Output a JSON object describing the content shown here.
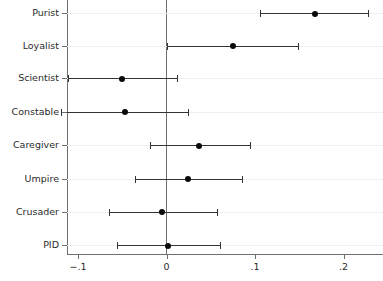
{
  "chart_data": {
    "type": "scatter",
    "subtype": "dot-and-whisker coefficient plot",
    "title": "",
    "subtitle": "",
    "xlabel": "",
    "ylabel": "",
    "xlim": [
      -0.13,
      0.245
    ],
    "ylim": [
      0,
      9
    ],
    "grid": true,
    "legend": null,
    "reference_line": 0,
    "xticks": [
      -0.1,
      0,
      0.1,
      0.2
    ],
    "xticklabels": [
      "−.1",
      "0",
      ".1",
      ".2"
    ],
    "categories": [
      "Purist",
      "Loyalist",
      "Scientist",
      "Constable",
      "Caregiver",
      "Umpire",
      "Crusader",
      "PID"
    ],
    "series": [
      {
        "name": "coefficient",
        "values": [
          0.168,
          0.075,
          -0.05,
          -0.047,
          0.037,
          0.024,
          -0.005,
          0.002
        ],
        "ci_low": [
          0.106,
          0.0,
          -0.111,
          -0.119,
          -0.019,
          -0.036,
          -0.065,
          -0.056
        ],
        "ci_high": [
          0.228,
          0.149,
          0.012,
          0.024,
          0.094,
          0.085,
          0.057,
          0.061
        ]
      }
    ],
    "points": [
      {
        "label": "Purist",
        "estimate": 0.168,
        "ci_low": 0.106,
        "ci_high": 0.228
      },
      {
        "label": "Loyalist",
        "estimate": 0.075,
        "ci_low": 0.0,
        "ci_high": 0.149
      },
      {
        "label": "Scientist",
        "estimate": -0.05,
        "ci_low": -0.111,
        "ci_high": 0.012
      },
      {
        "label": "Constable",
        "estimate": -0.047,
        "ci_low": -0.119,
        "ci_high": 0.024
      },
      {
        "label": "Caregiver",
        "estimate": 0.037,
        "ci_low": -0.019,
        "ci_high": 0.094
      },
      {
        "label": "Umpire",
        "estimate": 0.024,
        "ci_low": -0.036,
        "ci_high": 0.085
      },
      {
        "label": "Crusader",
        "estimate": -0.005,
        "ci_low": -0.065,
        "ci_high": 0.057
      },
      {
        "label": "PID",
        "estimate": 0.002,
        "ci_low": -0.056,
        "ci_high": 0.061
      }
    ],
    "colors": {
      "marker": "#0a0a0a",
      "whisker": "#333333",
      "axis": "#6f6f6f",
      "grid": "#efefef",
      "background": "#ffffff",
      "text": "#2b2b2b"
    }
  }
}
